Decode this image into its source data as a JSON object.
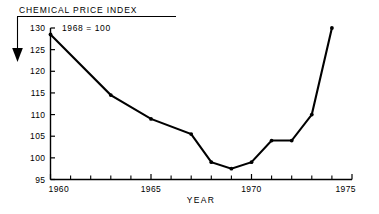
{
  "chart_data": {
    "type": "line",
    "title": "CHEMICAL PRICE INDEX",
    "subtitle": "1968 = 100",
    "xlabel": "YEAR",
    "ylabel": "",
    "xlim": [
      1960,
      1975
    ],
    "ylim": [
      95,
      130
    ],
    "grid": false,
    "legend": "none",
    "xticks": [
      1960,
      1965,
      1970,
      1975
    ],
    "xtick_labels": [
      "1960",
      "1965",
      "1970",
      "1975"
    ],
    "x_minor_tick_step": 1,
    "yticks": [
      95,
      100,
      105,
      110,
      115,
      120,
      125,
      130
    ],
    "ytick_labels": [
      "95",
      "100",
      "105",
      "110",
      "115",
      "120",
      "125",
      "130"
    ],
    "x": [
      1960,
      1963,
      1965,
      1967,
      1968,
      1969,
      1970,
      1971,
      1972,
      1973,
      1974
    ],
    "values": [
      128.5,
      114.5,
      109,
      105.5,
      99,
      97.5,
      99,
      104,
      104,
      110,
      130
    ],
    "series": [
      {
        "name": "Chemical Price Index",
        "color": "#000000",
        "marker": "dot",
        "values": [
          128.5,
          114.5,
          109,
          105.5,
          99,
          97.5,
          99,
          104,
          104,
          110,
          130
        ]
      }
    ],
    "annotations": [
      {
        "name": "title-pointer-arrow",
        "description": "downward arrow from title to y-axis"
      }
    ]
  },
  "colors": {
    "line": "#000000",
    "axis": "#000000",
    "background": "#ffffff"
  }
}
